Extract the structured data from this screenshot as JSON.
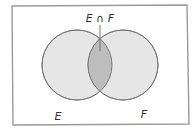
{
  "diagram": {
    "type": "venn",
    "sets": [
      {
        "label": "E"
      },
      {
        "label": "F"
      }
    ],
    "intersection_label": "E ∩ F",
    "colors": {
      "background": "#ffffff",
      "frame": "#9a9a9a",
      "set_fill": "#e6e6e6",
      "intersection_fill": "#bdbdbd",
      "outline": "#7a7a7a",
      "text": "#333333"
    }
  }
}
